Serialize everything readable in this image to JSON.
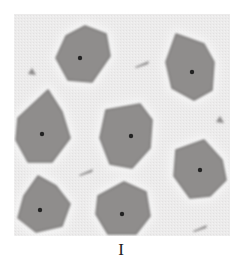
{
  "figure": {
    "caption": "I",
    "colors": {
      "background": "#ecebeb",
      "cell_fill": "#8f8d8c",
      "cell_edge": "#7a7877",
      "nucleus": "#222222",
      "halo": "#f8f8f8",
      "debris": "#8a8888"
    },
    "cells": [
      {
        "id": 1,
        "points": "66,36 85,26 106,34 110,56 92,82 68,80 56,58",
        "nucleus": [
          80,
          58
        ]
      },
      {
        "id": 2,
        "points": "176,34 204,44 214,62 212,90 194,100 172,88 166,62",
        "nucleus": [
          192,
          72
        ]
      },
      {
        "id": 3,
        "points": "18,118 48,90 62,112 70,138 52,162 28,162 16,140",
        "nucleus": [
          42,
          134
        ]
      },
      {
        "id": 4,
        "points": "106,110 140,104 152,120 150,148 132,168 110,164 100,138",
        "nucleus": [
          131,
          136
        ]
      },
      {
        "id": 5,
        "points": "176,150 204,140 222,160 226,180 210,196 190,198 174,176",
        "nucleus": [
          200,
          170
        ]
      },
      {
        "id": 6,
        "points": "24,196 38,176 56,186 70,204 62,226 36,232 18,218",
        "nucleus": [
          40,
          210
        ]
      },
      {
        "id": 7,
        "points": "98,196 124,182 146,192 150,216 136,234 108,234 96,214",
        "nucleus": [
          122,
          214
        ]
      }
    ],
    "debris": [
      {
        "x": 32,
        "y": 72,
        "shape": "tri"
      },
      {
        "x": 142,
        "y": 64,
        "shape": "streak"
      },
      {
        "x": 86,
        "y": 172,
        "shape": "streak"
      },
      {
        "x": 220,
        "y": 120,
        "shape": "tri"
      },
      {
        "x": 200,
        "y": 228,
        "shape": "streak"
      }
    ]
  }
}
